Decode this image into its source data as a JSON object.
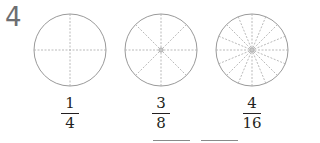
{
  "question_number": "4",
  "figures": [
    {
      "parts": 4,
      "fraction": {
        "numerator": "1",
        "denominator": "4"
      }
    },
    {
      "parts": 8,
      "fraction": {
        "numerator": "3",
        "denominator": "8"
      }
    },
    {
      "parts": 16,
      "fraction": {
        "numerator": "4",
        "denominator": "16"
      }
    }
  ],
  "answer_blanks": 2,
  "colors": {
    "circle": "#9a9a9a",
    "dash": "#a8a8a8",
    "text": "#231f20",
    "number": "#6d6e71"
  }
}
